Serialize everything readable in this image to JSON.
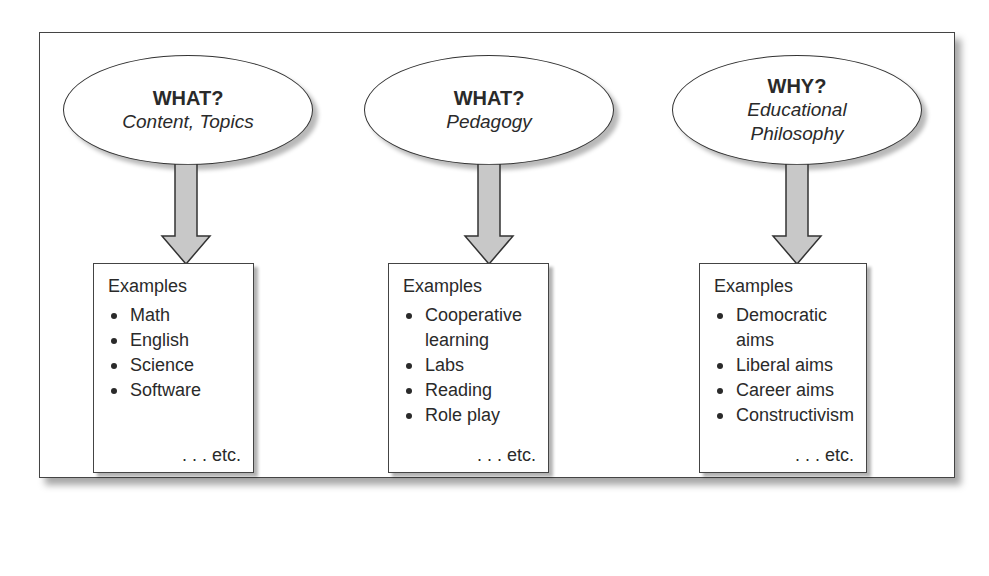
{
  "columns": [
    {
      "question": "WHAT?",
      "subtitle_lines": [
        "Content, Topics"
      ],
      "examples_heading": "Examples",
      "examples": [
        "Math",
        "English",
        "Science",
        "Software"
      ],
      "etc": ". . . etc."
    },
    {
      "question": "WHAT?",
      "subtitle_lines": [
        "Pedagogy"
      ],
      "examples_heading": "Examples",
      "examples": [
        "Cooperative learning",
        "Labs",
        "Reading",
        "Role play"
      ],
      "etc": ". . . etc."
    },
    {
      "question": "WHY?",
      "subtitle_lines": [
        "Educational",
        "Philosophy"
      ],
      "examples_heading": "Examples",
      "examples": [
        "Democratic aims",
        "Liberal aims",
        "Career aims",
        "Constructivism"
      ],
      "etc": ". . . etc."
    }
  ],
  "colors": {
    "arrow_fill": "#c8c8c8",
    "stroke": "#333333",
    "text": "#2a2a2a"
  }
}
